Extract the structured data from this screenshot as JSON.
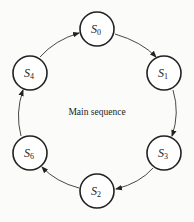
{
  "diagram": {
    "caption": "Main sequence",
    "nodes": [
      {
        "id": "S0",
        "base": "S",
        "sub": "0",
        "x": 97,
        "y": 29
      },
      {
        "id": "S1",
        "base": "S",
        "sub": "1",
        "x": 164,
        "y": 73
      },
      {
        "id": "S3",
        "base": "S",
        "sub": "3",
        "x": 164,
        "y": 153
      },
      {
        "id": "S2",
        "base": "S",
        "sub": "2",
        "x": 97,
        "y": 191
      },
      {
        "id": "S6",
        "base": "S",
        "sub": "6",
        "x": 30,
        "y": 153
      },
      {
        "id": "S4",
        "base": "S",
        "sub": "4",
        "x": 30,
        "y": 73
      }
    ],
    "edges": [
      {
        "from": "S0",
        "to": "S1"
      },
      {
        "from": "S1",
        "to": "S3"
      },
      {
        "from": "S3",
        "to": "S2"
      },
      {
        "from": "S2",
        "to": "S6"
      },
      {
        "from": "S6",
        "to": "S4"
      },
      {
        "from": "S4",
        "to": "S0"
      }
    ]
  }
}
